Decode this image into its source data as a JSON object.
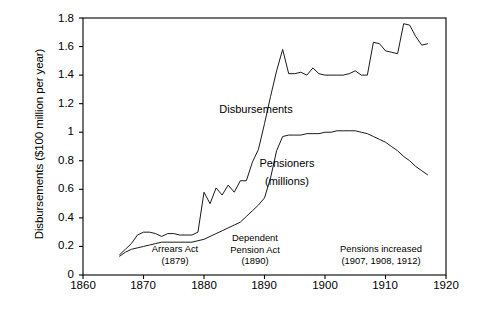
{
  "chart_data": {
    "type": "line",
    "title": "",
    "xlabel": "",
    "ylabel": "Disbursements ($100 million per year)",
    "xlim": [
      1860,
      1920
    ],
    "ylim": [
      0,
      1.8
    ],
    "grid": false,
    "legend_position": "inline-labels",
    "xticks": [
      "1860",
      "1870",
      "1880",
      "1890",
      "1900",
      "1910",
      "1920"
    ],
    "yticks": [
      "0",
      "0.2",
      "0.4",
      "0.6",
      "0.8",
      "1",
      "1.2",
      "1.4",
      "1.6",
      "1.8"
    ],
    "series": [
      {
        "name": "Disbursements",
        "label": "Disbursements",
        "x": [
          1866,
          1867,
          1868,
          1869,
          1870,
          1871,
          1872,
          1873,
          1874,
          1875,
          1876,
          1877,
          1878,
          1879,
          1880,
          1881,
          1882,
          1883,
          1884,
          1885,
          1886,
          1887,
          1888,
          1889,
          1890,
          1891,
          1892,
          1893,
          1894,
          1895,
          1896,
          1897,
          1898,
          1899,
          1900,
          1901,
          1902,
          1903,
          1904,
          1905,
          1906,
          1907,
          1908,
          1909,
          1910,
          1911,
          1912,
          1913,
          1914,
          1915,
          1916,
          1917
        ],
        "values": [
          0.14,
          0.18,
          0.22,
          0.28,
          0.3,
          0.3,
          0.29,
          0.27,
          0.29,
          0.29,
          0.28,
          0.28,
          0.28,
          0.3,
          0.58,
          0.5,
          0.61,
          0.56,
          0.63,
          0.58,
          0.66,
          0.66,
          0.79,
          0.88,
          1.06,
          1.25,
          1.43,
          1.58,
          1.41,
          1.41,
          1.42,
          1.4,
          1.45,
          1.41,
          1.4,
          1.4,
          1.4,
          1.4,
          1.41,
          1.43,
          1.4,
          1.4,
          1.63,
          1.62,
          1.57,
          1.56,
          1.55,
          1.76,
          1.75,
          1.67,
          1.61,
          1.62
        ]
      },
      {
        "name": "Pensioners",
        "label": "Pensioners",
        "sublabel": "(millions)",
        "x": [
          1866,
          1867,
          1868,
          1869,
          1870,
          1871,
          1872,
          1873,
          1874,
          1875,
          1876,
          1877,
          1878,
          1879,
          1880,
          1881,
          1882,
          1883,
          1884,
          1885,
          1886,
          1887,
          1888,
          1889,
          1890,
          1891,
          1892,
          1893,
          1894,
          1895,
          1896,
          1897,
          1898,
          1899,
          1900,
          1901,
          1902,
          1903,
          1904,
          1905,
          1906,
          1907,
          1908,
          1909,
          1910,
          1911,
          1912,
          1913,
          1914,
          1915,
          1916,
          1917
        ],
        "values": [
          0.13,
          0.16,
          0.18,
          0.19,
          0.2,
          0.21,
          0.22,
          0.23,
          0.23,
          0.23,
          0.23,
          0.23,
          0.23,
          0.24,
          0.25,
          0.27,
          0.29,
          0.31,
          0.33,
          0.35,
          0.37,
          0.41,
          0.45,
          0.49,
          0.54,
          0.68,
          0.87,
          0.97,
          0.98,
          0.98,
          0.98,
          0.99,
          0.99,
          0.99,
          1.0,
          1.0,
          1.01,
          1.01,
          1.01,
          1.01,
          1.0,
          0.99,
          0.97,
          0.95,
          0.93,
          0.9,
          0.87,
          0.83,
          0.8,
          0.76,
          0.73,
          0.7
        ]
      }
    ],
    "annotations": [
      {
        "id": "arrears-act",
        "line1": "Arrears Act",
        "line2": "(1879)",
        "x": 1879
      },
      {
        "id": "dependent-pension-act",
        "line1": "Dependent",
        "line2": "Pension Act",
        "line3": "(1890)",
        "x": 1890
      },
      {
        "id": "pensions-increased",
        "line1": "Pensions increased",
        "line2": "(1907, 1908, 1912)",
        "x": 1909
      }
    ],
    "colors": {
      "line": "#1a1a1a",
      "axis": "#000000",
      "background": "#ffffff"
    }
  }
}
